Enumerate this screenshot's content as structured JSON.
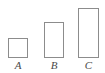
{
  "figure": {
    "type": "bar-comparison-diagram",
    "background_color": "#ffffff",
    "stroke_color": "#8c8c8c",
    "fill_color": "#ffffff",
    "label_color": "#4a4a4a",
    "baseline_y": 58
  },
  "chart_data": {
    "type": "bar",
    "title": "",
    "subtitle": "",
    "xlabel": "",
    "ylabel": "",
    "categories": [
      "A",
      "B",
      "C"
    ],
    "values": [
      20,
      36,
      50
    ],
    "ylim": [
      0,
      50
    ],
    "grid": false,
    "legend": false,
    "legend_position": "none",
    "orientation": "vertical",
    "bars": [
      {
        "label": "A",
        "x": 8,
        "y": 38,
        "width": 20,
        "height": 20,
        "label_x": 8,
        "label_y": 59,
        "label_width": 20
      },
      {
        "label": "B",
        "x": 44,
        "y": 22,
        "width": 20,
        "height": 36,
        "label_x": 44,
        "label_y": 59,
        "label_width": 20
      },
      {
        "label": "C",
        "x": 78,
        "y": 8,
        "width": 21,
        "height": 50,
        "label_x": 78,
        "label_y": 59,
        "label_width": 21
      }
    ]
  }
}
